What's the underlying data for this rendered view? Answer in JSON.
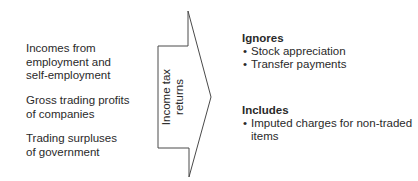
{
  "sources": [
    {
      "lines": [
        "Incomes from",
        "employment and",
        "self-employment"
      ]
    },
    {
      "lines": [
        "Gross trading profits",
        "of companies"
      ]
    },
    {
      "lines": [
        "Trading surpluses",
        "of government"
      ]
    }
  ],
  "arrow": {
    "label_line1": "Income tax",
    "label_line2": "returns",
    "stroke_color": "#4a4a4a"
  },
  "ignores": {
    "heading": "Ignores",
    "items": [
      "Stock appreciation",
      "Transfer payments"
    ]
  },
  "includes": {
    "heading": "Includes",
    "items": [
      {
        "line1": "Imputed charges for non-traded",
        "line2": "items"
      }
    ]
  },
  "bullet_glyph": "•"
}
